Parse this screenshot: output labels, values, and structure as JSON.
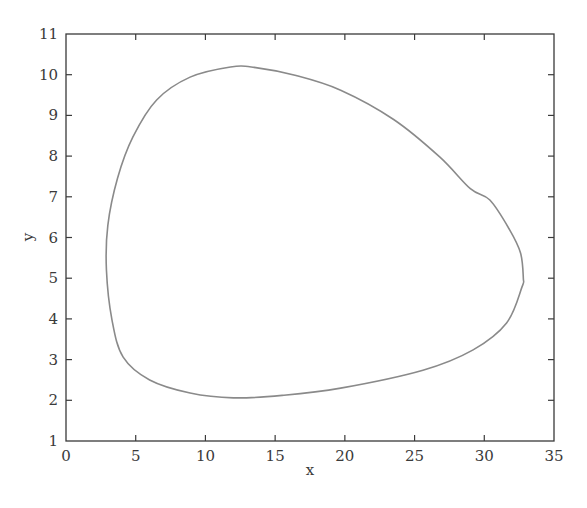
{
  "chart_data": {
    "type": "line",
    "title": "",
    "xlabel": "x",
    "ylabel": "y",
    "xlim": [
      0,
      35
    ],
    "ylim": [
      1,
      11
    ],
    "xticks": [
      0,
      5,
      10,
      15,
      20,
      25,
      30,
      35
    ],
    "yticks": [
      1,
      2,
      3,
      4,
      5,
      6,
      7,
      8,
      9,
      10,
      11
    ],
    "grid": false,
    "legend": null,
    "ticks_direction": "in",
    "box": true,
    "line_color": "#8a8a8a",
    "axis_color": "#3a3a3a",
    "series": [
      {
        "name": "limit cycle (phase portrait)",
        "closed": true,
        "points": [
          [
            2.9,
            5.2
          ],
          [
            3.0,
            6.3
          ],
          [
            3.7,
            7.46
          ],
          [
            4.8,
            8.47
          ],
          [
            6.5,
            9.38
          ],
          [
            8.9,
            9.94
          ],
          [
            11.8,
            10.19
          ],
          [
            13.5,
            10.18
          ],
          [
            16.5,
            9.98
          ],
          [
            19.7,
            9.62
          ],
          [
            23.5,
            8.9
          ],
          [
            26.8,
            7.98
          ],
          [
            29.0,
            7.2
          ],
          [
            30.4,
            6.92
          ],
          [
            31.8,
            6.2
          ],
          [
            32.6,
            5.62
          ],
          [
            32.8,
            5.0
          ],
          [
            32.7,
            4.78
          ],
          [
            31.6,
            3.9
          ],
          [
            29.2,
            3.24
          ],
          [
            25.6,
            2.74
          ],
          [
            19.7,
            2.3
          ],
          [
            15.5,
            2.12
          ],
          [
            12.0,
            2.06
          ],
          [
            8.9,
            2.18
          ],
          [
            6.0,
            2.5
          ],
          [
            4.1,
            3.06
          ],
          [
            3.3,
            3.97
          ]
        ]
      }
    ],
    "extents": {
      "x_min": 2.9,
      "x_min_at_y": 5.2,
      "x_max": 32.8,
      "x_max_at_y": 5.0,
      "y_max": 10.2,
      "y_max_at_x": 12.5,
      "y_min": 2.0,
      "y_min_at_x": 11.5
    }
  },
  "figure": {
    "cut_off_caption_fragment": ""
  }
}
